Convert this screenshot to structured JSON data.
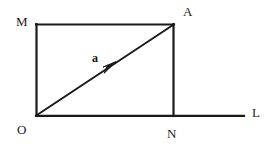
{
  "figure": {
    "type": "geometry-vector-diagram",
    "background_color": "#ffffff",
    "stroke_color": "#1a1a1a",
    "labels": {
      "origin": "O",
      "top_left": "M",
      "top_right": "A",
      "bottom_right": "N",
      "line_end": "L",
      "vector": "a"
    },
    "geometry": {
      "points": {
        "O": [
          36,
          116
        ],
        "M": [
          36,
          24
        ],
        "A": [
          174,
          24
        ],
        "N": [
          174,
          116
        ],
        "L": [
          244,
          116
        ]
      },
      "segments": [
        {
          "name": "OM",
          "from": "O",
          "to": "M"
        },
        {
          "name": "MA",
          "from": "M",
          "to": "A"
        },
        {
          "name": "AN",
          "from": "A",
          "to": "N"
        },
        {
          "name": "OL",
          "from": "O",
          "to": "L"
        }
      ],
      "vector": {
        "name": "a",
        "from": "O",
        "to": "A",
        "arrow_at": [
          115,
          62
        ]
      }
    }
  }
}
